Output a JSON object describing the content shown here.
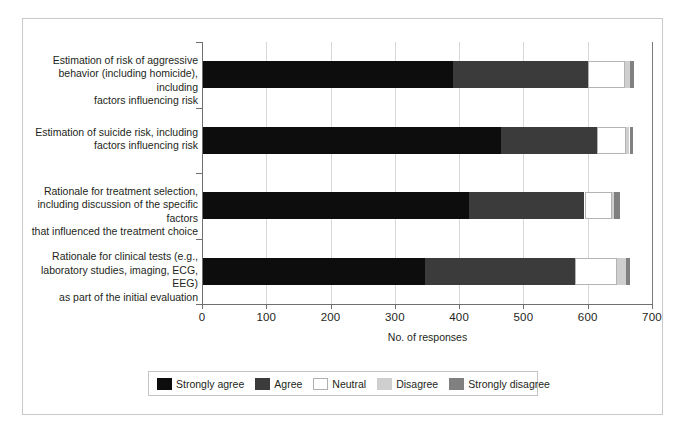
{
  "chart_data": {
    "type": "bar",
    "orientation": "horizontal",
    "stacked": true,
    "title": "",
    "xlabel": "No. of responses",
    "ylabel": "",
    "xlim": [
      0,
      700
    ],
    "xticks": [
      "0",
      "100",
      "200",
      "300",
      "400",
      "500",
      "600",
      "700"
    ],
    "xtick_values": [
      0,
      100,
      200,
      300,
      400,
      500,
      600,
      700
    ],
    "grid": "vertical",
    "legend_position": "bottom",
    "categories": [
      "Estimation of risk of aggressive behavior (including homicide), including factors influencing risk",
      "Estimation of suicide risk, including factors influencing risk",
      "Rationale for treatment selection, including discussion of the specific factors that influenced the treatment choice",
      "Rationale for clinical tests (e.g., laboratory studies, imaging, ECG, EEG) as part of the initial evaluation"
    ],
    "category_lines": [
      [
        "Estimation of risk of aggressive",
        "behavior (including homicide), including",
        "factors influencing risk"
      ],
      [
        "Estimation of suicide risk, including",
        "factors influencing risk"
      ],
      [
        "Rationale for treatment selection,",
        "including discussion of the specific factors",
        "that influenced the treatment choice"
      ],
      [
        "Rationale for clinical tests (e.g.,",
        "laboratory studies, imaging, ECG, EEG)",
        "as part of the initial evaluation"
      ]
    ],
    "series": [
      {
        "name": "Strongly agree",
        "color": "#0d0d0d",
        "values": [
          390,
          465,
          415,
          347
        ]
      },
      {
        "name": "Agree",
        "color": "#3b3b3b",
        "values": [
          210,
          150,
          180,
          233
        ]
      },
      {
        "name": "Neutral",
        "color": "#ffffff",
        "values": [
          58,
          45,
          42,
          65
        ]
      },
      {
        "name": "Disagree",
        "color": "#cfcfcf",
        "values": [
          8,
          5,
          4,
          14
        ]
      },
      {
        "name": "Strongly disagree",
        "color": "#808080",
        "values": [
          6,
          5,
          9,
          7
        ]
      }
    ],
    "totals": [
      672,
      670,
      650,
      666
    ]
  },
  "legend": {
    "items": [
      {
        "label": "Strongly agree",
        "swatch": "sa"
      },
      {
        "label": "Agree",
        "swatch": "a"
      },
      {
        "label": "Neutral",
        "swatch": "n"
      },
      {
        "label": "Disagree",
        "swatch": "d"
      },
      {
        "label": "Strongly disagree",
        "swatch": "sd"
      }
    ]
  },
  "colors": {
    "strongly_agree": "#0d0d0d",
    "agree": "#3b3b3b",
    "neutral": "#ffffff",
    "disagree": "#cfcfcf",
    "strongly_disagree": "#808080",
    "axis": "#6f6f6f",
    "grid": "#d8d8d8",
    "text": "#231f20",
    "frame": "#c9c9c9"
  }
}
